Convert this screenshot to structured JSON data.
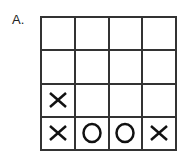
{
  "label": "A.",
  "grid": {
    "rows": 4,
    "cols": 4,
    "cells": [
      [
        "",
        "",
        "",
        ""
      ],
      [
        "",
        "",
        "",
        ""
      ],
      [
        "X",
        "",
        "",
        ""
      ],
      [
        "X",
        "O",
        "O",
        "X"
      ]
    ]
  }
}
